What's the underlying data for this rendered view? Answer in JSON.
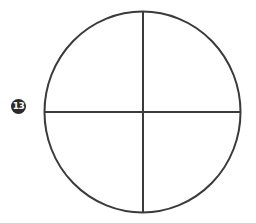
{
  "figure": {
    "label_number": "13",
    "shape": "circle divided into four quadrants",
    "stroke_color": "#3a3a3a",
    "badge_color": "#2b2b2b",
    "background": "#ffffff"
  }
}
